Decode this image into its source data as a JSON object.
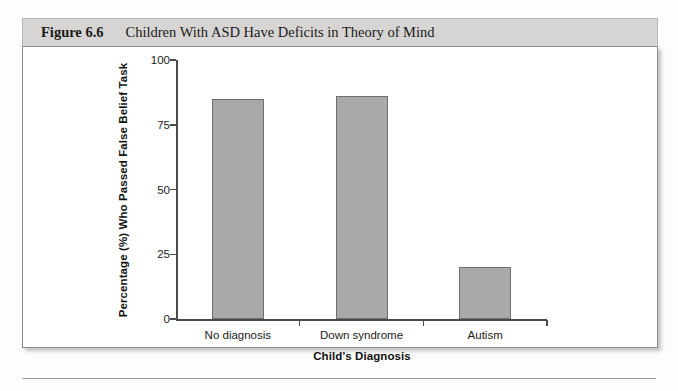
{
  "figure": {
    "number": "Figure 6.6",
    "caption": "Children With ASD Have Deficits in Theory of Mind"
  },
  "chart_data": {
    "type": "bar",
    "title": "Children With ASD Have Deficits in Theory of Mind",
    "categories": [
      "No diagnosis",
      "Down syndrome",
      "Autism"
    ],
    "values": [
      85,
      86,
      20
    ],
    "xlabel": "Child's Diagnosis",
    "ylabel": "Percentage (%) Who Passed False Belief Task",
    "ylim": [
      0,
      100
    ],
    "yticks": [
      0,
      25,
      50,
      75,
      100
    ],
    "ytick_labels": [
      "0",
      "25",
      "50",
      "75",
      "100"
    ],
    "grid": false,
    "legend": null,
    "bar_color": "#a9a9a9",
    "bar_edge_color": "#6f6f6f",
    "axis_color": "#4a4a4a"
  }
}
